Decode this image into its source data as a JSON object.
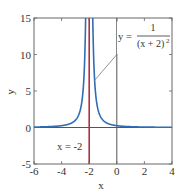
{
  "chart_data": {
    "type": "line",
    "title": "",
    "xlabel": "x",
    "ylabel": "y",
    "xlim": [
      -6,
      4
    ],
    "ylim": [
      -5,
      15
    ],
    "grid": false,
    "legend": null,
    "x_ticks": [
      -6,
      -4,
      -2,
      0,
      2,
      4
    ],
    "x_tick_labels": [
      "-6",
      "-4",
      "-2",
      "0",
      "2",
      "4"
    ],
    "y_ticks": [
      -5,
      0,
      5,
      10,
      15
    ],
    "y_tick_labels": [
      "-5",
      "0",
      "5",
      "10",
      "15"
    ],
    "series": [
      {
        "name": "y = 1/(x + 2)^2",
        "function": "1/(x+2)^2",
        "color": "#2f6db5",
        "sample_points": [
          [
            -6,
            0.0625
          ],
          [
            -5,
            0.111
          ],
          [
            -4,
            0.25
          ],
          [
            -3,
            1.0
          ],
          [
            -2.5,
            4.0
          ],
          [
            -2.26,
            14.8
          ],
          [
            -1.74,
            14.8
          ],
          [
            -1.5,
            4.0
          ],
          [
            -1,
            1.0
          ],
          [
            0,
            0.25
          ],
          [
            1,
            0.111
          ],
          [
            2,
            0.0625
          ],
          [
            3,
            0.04
          ],
          [
            4,
            0.0278
          ]
        ]
      }
    ],
    "reference_lines": [
      {
        "name": "vertical asymptote",
        "orientation": "vertical",
        "value": -2,
        "color": "#b0303f"
      },
      {
        "name": "x-axis",
        "orientation": "horizontal",
        "value": 0,
        "color": "#555555"
      },
      {
        "name": "y-axis",
        "orientation": "vertical",
        "value": 0,
        "color": "#555555"
      }
    ],
    "annotations": [
      {
        "text_lhs": "y =",
        "numerator": "1",
        "denominator": "(x + 2)",
        "exponent": "2",
        "points_to": [
          -1.66,
          6.3
        ]
      },
      {
        "text": "x = -2",
        "position": [
          -3.5,
          -2.7
        ]
      }
    ]
  },
  "labels": {
    "xlabel": "x",
    "ylabel": "y",
    "curve_lhs": "y =",
    "curve_numerator": "1",
    "curve_denominator": "(x + 2)",
    "curve_exponent": "2",
    "asymptote_label": "x = -2"
  },
  "colors": {
    "curve": "#2f6db5",
    "asymptote": "#b0303f",
    "axes": "#555555",
    "frame": "#666666",
    "leader": "#777777"
  }
}
